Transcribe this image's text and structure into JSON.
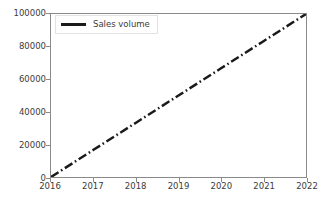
{
  "chart_data": {
    "type": "line",
    "title": "",
    "xlabel": "",
    "ylabel": "",
    "xlim": [
      2016,
      2022
    ],
    "ylim": [
      0,
      100000
    ],
    "grid": false,
    "legend_position": "upper left",
    "line_style": "dash-dot",
    "line_color": "#1a1a1a",
    "line_width": 2.5,
    "xticks": [
      2016,
      2017,
      2018,
      2019,
      2020,
      2021,
      2022
    ],
    "xtick_labels": [
      "2016",
      "2017",
      "2018",
      "2019",
      "2020",
      "2021",
      "2022"
    ],
    "yticks": [
      0,
      20000,
      40000,
      60000,
      80000,
      100000
    ],
    "ytick_labels": [
      "0",
      "20000",
      "40000",
      "60000",
      "80000",
      "100000"
    ],
    "series": [
      {
        "name": "Sales volume",
        "x": [
          2016,
          2017,
          2018,
          2019,
          2020,
          2021,
          2022
        ],
        "values": [
          0,
          16667,
          33333,
          50000,
          66667,
          83333,
          100000
        ]
      }
    ]
  },
  "legend": {
    "entries": [
      {
        "label": "Sales volume",
        "color": "#1a1a1a"
      }
    ]
  }
}
